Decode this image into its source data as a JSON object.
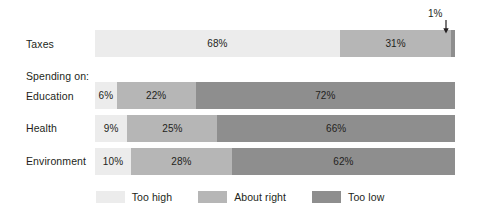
{
  "chart_data": {
    "type": "bar",
    "orientation": "horizontal",
    "stacked": true,
    "normalized_percent": true,
    "title": "",
    "xlabel": "",
    "ylabel": "",
    "xlim": [
      0,
      100
    ],
    "grid": false,
    "legend_position": "bottom",
    "categories": [
      "Taxes",
      "Education",
      "Health",
      "Environment"
    ],
    "series": [
      {
        "name": "Too high",
        "color": "#ececec",
        "values": [
          68,
          6,
          9,
          10
        ],
        "labels": [
          "68%",
          "6%",
          "9%",
          "10%"
        ]
      },
      {
        "name": "About right",
        "color": "#b6b6b6",
        "values": [
          31,
          22,
          25,
          28
        ],
        "labels": [
          "31%",
          "22%",
          "25%",
          "28%"
        ]
      },
      {
        "name": "Too low",
        "color": "#8e8e8e",
        "values": [
          1,
          72,
          66,
          62
        ],
        "labels": [
          "1%",
          "72%",
          "66%",
          "62%"
        ]
      }
    ],
    "annotations": [
      {
        "text": "1%",
        "points_to": "Taxes / Too low segment",
        "arrow": "down"
      }
    ],
    "group_heading": "Spending on:"
  },
  "rows": [
    {
      "label": "Taxes",
      "label_top": 38,
      "bar_top": 30,
      "segments": [
        {
          "name": "too-high",
          "value": 68,
          "label": "68%",
          "show_label": true,
          "color": "#ececec"
        },
        {
          "name": "about-right",
          "value": 31,
          "label": "31%",
          "show_label": true,
          "color": "#b6b6b6"
        },
        {
          "name": "too-low",
          "value": 1,
          "label": "1%",
          "show_label": false,
          "color": "#8e8e8e"
        }
      ]
    },
    {
      "label": "Education",
      "label_top": 90,
      "bar_top": 82,
      "segments": [
        {
          "name": "too-high",
          "value": 6,
          "label": "6%",
          "show_label": true,
          "color": "#ececec"
        },
        {
          "name": "about-right",
          "value": 22,
          "label": "22%",
          "show_label": true,
          "color": "#b6b6b6"
        },
        {
          "name": "too-low",
          "value": 72,
          "label": "72%",
          "show_label": true,
          "color": "#8e8e8e"
        }
      ]
    },
    {
      "label": "Health",
      "label_top": 122,
      "bar_top": 115,
      "segments": [
        {
          "name": "too-high",
          "value": 9,
          "label": "9%",
          "show_label": true,
          "color": "#ececec"
        },
        {
          "name": "about-right",
          "value": 25,
          "label": "25%",
          "show_label": true,
          "color": "#b6b6b6"
        },
        {
          "name": "too-low",
          "value": 66,
          "label": "66%",
          "show_label": true,
          "color": "#8e8e8e"
        }
      ]
    },
    {
      "label": "Environment",
      "label_top": 155,
      "bar_top": 148,
      "segments": [
        {
          "name": "too-high",
          "value": 10,
          "label": "10%",
          "show_label": true,
          "color": "#ececec"
        },
        {
          "name": "about-right",
          "value": 28,
          "label": "28%",
          "show_label": true,
          "color": "#b6b6b6"
        },
        {
          "name": "too-low",
          "value": 62,
          "label": "62%",
          "show_label": true,
          "color": "#8e8e8e"
        }
      ]
    }
  ],
  "group_heading": {
    "text": "Spending on:",
    "top": 70
  },
  "annotation": {
    "text": "1%"
  },
  "legend": {
    "items": [
      {
        "label": "Too high",
        "color": "#ececec"
      },
      {
        "label": "About right",
        "color": "#b6b6b6"
      },
      {
        "label": "Too low",
        "color": "#8e8e8e"
      }
    ]
  }
}
